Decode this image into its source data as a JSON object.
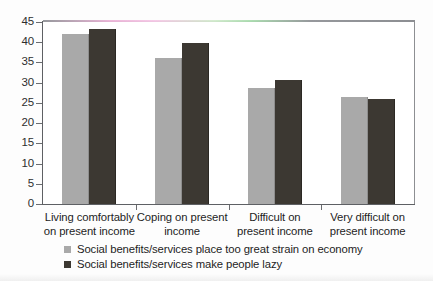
{
  "chart_data": {
    "type": "bar",
    "title": "",
    "subtitle": "",
    "xlabel": "",
    "ylabel": "",
    "ylim": [
      0,
      45
    ],
    "ytick_step": 5,
    "yticks": [
      "45",
      "40",
      "35",
      "30",
      "25",
      "20",
      "15",
      "10",
      "5",
      "0"
    ],
    "grid": false,
    "legend_position": "bottom",
    "orientation": "vertical",
    "grouped": true,
    "categories": [
      "Living comfortably on present income",
      "Coping on present income",
      "Difficult on present income",
      "Very difficult on present income"
    ],
    "category_lines": [
      [
        "Living comfortably",
        "on present income"
      ],
      [
        "Coping on present",
        "income"
      ],
      [
        "Difficult on",
        "present income"
      ],
      [
        "Very difficult on",
        "present income"
      ]
    ],
    "series": [
      {
        "name": "Social benefits/services place too great strain on economy",
        "color": "#a9a9a9",
        "values": [
          42.0,
          36.2,
          28.6,
          26.5
        ]
      },
      {
        "name": "Social benefits/services make people lazy",
        "color": "#3c3832",
        "values": [
          43.2,
          39.8,
          30.6,
          26.0
        ]
      }
    ]
  },
  "legend": {
    "items": [
      {
        "label": "Social benefits/services place too great strain on economy",
        "color": "#a9a9a9"
      },
      {
        "label": "Social benefits/services make people lazy",
        "color": "#3c3832"
      }
    ]
  },
  "colors": {
    "series_light": "#a9a9a9",
    "series_dark": "#3c3832",
    "axis": "#5e6064",
    "frame": "#8d8f92",
    "text": "#1d1d1d",
    "background": "#ffffff"
  }
}
